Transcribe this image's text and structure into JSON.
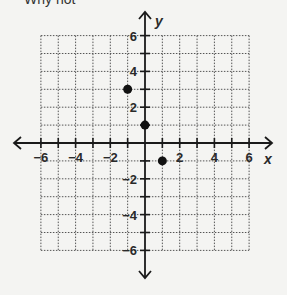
{
  "header": {
    "text": "Why not"
  },
  "chart_data": {
    "type": "scatter",
    "title": "",
    "xlabel": "x",
    "ylabel": "y",
    "xlim": [
      -6,
      6
    ],
    "ylim": [
      -6,
      6
    ],
    "grid": true,
    "x_tick_labels": [
      "-6",
      "-4",
      "-2",
      "2",
      "4",
      "6"
    ],
    "y_tick_labels": [
      "6",
      "4",
      "2",
      "-2",
      "-4",
      "-6"
    ],
    "points": [
      {
        "x": -1,
        "y": 3
      },
      {
        "x": 0,
        "y": 1
      },
      {
        "x": 1,
        "y": -1
      }
    ]
  },
  "colors": {
    "axis": "#1a1a1a",
    "grid": "#555555",
    "point": "#111111",
    "background": "#f4f4f2"
  }
}
